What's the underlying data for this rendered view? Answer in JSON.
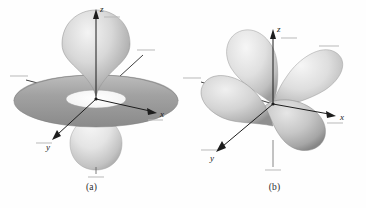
{
  "figure": {
    "background_color": "#fefefe",
    "ink_color": "#1d1d1d",
    "orbital_fill_light": "#efefef",
    "orbital_fill_mid": "#c9c9c9",
    "orbital_fill_dark": "#8f8f8f",
    "torus_fill_dark": "#9a9a9a",
    "panels": [
      {
        "id": "a",
        "caption": "(a)",
        "orbital_type": "d z-squared orbital with torus",
        "axes": [
          {
            "name": "z",
            "label": "z",
            "direction": "up"
          },
          {
            "name": "x",
            "label": "x",
            "direction": "right"
          },
          {
            "name": "y",
            "label": "y",
            "direction": "down-left"
          }
        ],
        "tick_marks": [
          {
            "name": "z-positive-tick"
          },
          {
            "name": "z-negative-tick"
          },
          {
            "name": "x-positive-tick"
          },
          {
            "name": "y-positive-tick"
          },
          {
            "name": "left-axis-tick"
          },
          {
            "name": "upper-right-axis-tick"
          }
        ]
      },
      {
        "id": "b",
        "caption": "(b)",
        "orbital_type": "four-lobed d orbital",
        "axes": [
          {
            "name": "z",
            "label": "z",
            "direction": "up"
          },
          {
            "name": "x",
            "label": "x",
            "direction": "right"
          },
          {
            "name": "y",
            "label": "y",
            "direction": "down-left"
          }
        ],
        "tick_marks": [
          {
            "name": "z-positive-tick"
          },
          {
            "name": "z-negative-tick"
          },
          {
            "name": "x-positive-tick"
          },
          {
            "name": "y-positive-tick"
          },
          {
            "name": "left-axis-tick"
          },
          {
            "name": "upper-right-axis-tick"
          }
        ]
      }
    ]
  }
}
